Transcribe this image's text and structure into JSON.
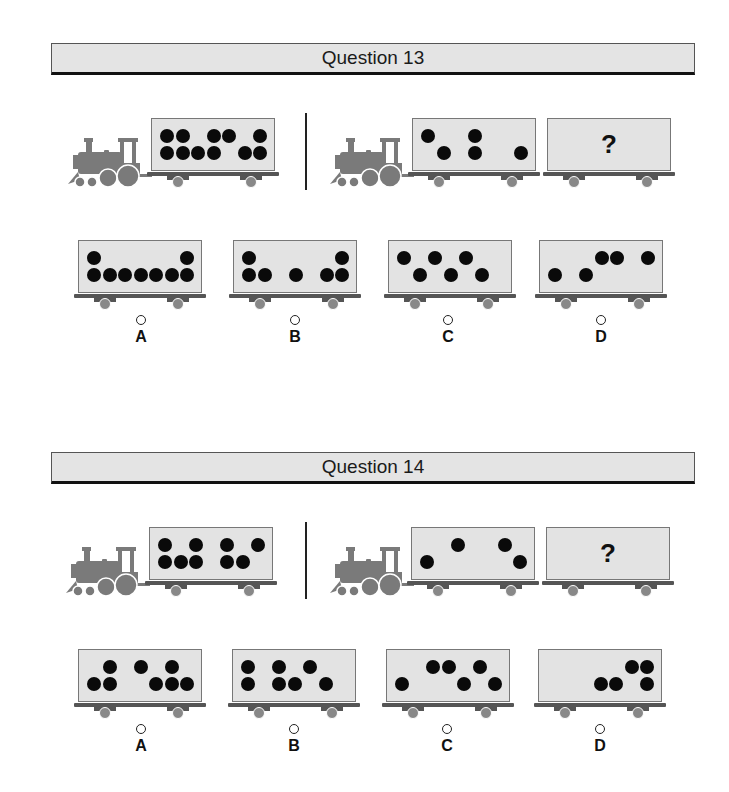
{
  "questions": [
    {
      "title": "Question 13",
      "example": {
        "car1": {
          "top": [
            1,
            2,
            4,
            5,
            7
          ],
          "bottom": [
            1,
            2,
            3,
            4,
            6,
            7
          ]
        },
        "car2": {
          "top": [
            1,
            4
          ],
          "bottom": [
            2,
            4,
            7
          ]
        },
        "unknown_label": "?"
      },
      "options": [
        {
          "label": "A",
          "top": [
            1,
            7
          ],
          "bottom": [
            1,
            2,
            3,
            4,
            5,
            6,
            7
          ]
        },
        {
          "label": "B",
          "top": [
            1,
            7
          ],
          "bottom": [
            1,
            2,
            4,
            6,
            7
          ]
        },
        {
          "label": "C",
          "top": [
            1,
            3,
            5
          ],
          "bottom": [
            2,
            4,
            6
          ]
        },
        {
          "label": "D",
          "top": [
            4,
            5,
            7
          ],
          "bottom": [
            1,
            3
          ]
        }
      ]
    },
    {
      "title": "Question 14",
      "example": {
        "car1": {
          "top": [
            1,
            3,
            5,
            7
          ],
          "bottom": [
            1,
            2,
            3,
            5,
            6
          ]
        },
        "car2": {
          "top": [
            3,
            6
          ],
          "bottom": [
            1,
            7
          ]
        },
        "unknown_label": "?"
      },
      "options": [
        {
          "label": "A",
          "top": [
            2,
            4,
            6
          ],
          "bottom": [
            1,
            2,
            5,
            6,
            7
          ]
        },
        {
          "label": "B",
          "top": [
            1,
            3,
            5
          ],
          "bottom": [
            1,
            3,
            4,
            6
          ]
        },
        {
          "label": "C",
          "top": [
            3,
            4,
            6
          ],
          "bottom": [
            1,
            5,
            7
          ]
        },
        {
          "label": "D",
          "top": [
            6,
            7
          ],
          "bottom": [
            4,
            5,
            7
          ]
        }
      ]
    }
  ],
  "colors": {
    "header_bg": "#e4e4e4",
    "car_bg": "#e3e3e3",
    "engine": "#7a7a7a",
    "dot": "#0a0a0a"
  }
}
